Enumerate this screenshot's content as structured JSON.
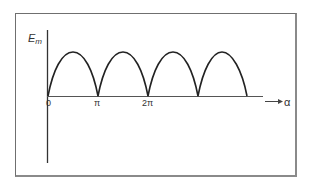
{
  "diagram": {
    "y_axis": {
      "label_main": "E",
      "label_sub": "m"
    },
    "x_axis": {
      "label": "α",
      "ticks": [
        "0",
        "π",
        "2π"
      ]
    },
    "curve": {
      "type": "rectified-sine",
      "humps": 4,
      "color": "#222222"
    }
  }
}
